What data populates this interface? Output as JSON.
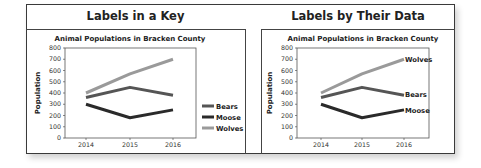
{
  "panels": {
    "left_title": "Labels in a Key",
    "right_title": "Labels by Their Data"
  },
  "chart_data": [
    {
      "type": "line",
      "title": "Animal Populations in Bracken County",
      "panel_heading": "Labels in a Key",
      "xlabel": "",
      "ylabel": "Population",
      "x": [
        "2014",
        "2015",
        "2016"
      ],
      "ylim": [
        0,
        800
      ],
      "yticks": [
        0,
        100,
        200,
        300,
        400,
        500,
        600,
        700,
        800
      ],
      "grid": false,
      "legend_position": "right",
      "series": [
        {
          "name": "Bears",
          "values": [
            360,
            450,
            380
          ],
          "color": "#555555"
        },
        {
          "name": "Moose",
          "values": [
            300,
            180,
            250
          ],
          "color": "#2a2a2a"
        },
        {
          "name": "Wolves",
          "values": [
            400,
            570,
            700
          ],
          "color": "#9a9a9a"
        }
      ]
    },
    {
      "type": "line",
      "title": "Animal Populations in Bracken County",
      "panel_heading": "Labels by Their Data",
      "xlabel": "",
      "ylabel": "Population",
      "x": [
        "2014",
        "2015",
        "2016"
      ],
      "ylim": [
        0,
        800
      ],
      "yticks": [
        0,
        100,
        200,
        300,
        400,
        500,
        600,
        700,
        800
      ],
      "grid": false,
      "legend_position": "none (direct labels at line ends)",
      "series": [
        {
          "name": "Bears",
          "values": [
            360,
            450,
            380
          ],
          "color": "#555555"
        },
        {
          "name": "Moose",
          "values": [
            300,
            180,
            250
          ],
          "color": "#2a2a2a"
        },
        {
          "name": "Wolves",
          "values": [
            400,
            570,
            700
          ],
          "color": "#9a9a9a"
        }
      ]
    }
  ],
  "legend": {
    "bears": "Bears",
    "moose": "Moose",
    "wolves": "Wolves"
  },
  "axes": {
    "title": "Animal Populations in Bracken County",
    "ylabel": "Population",
    "xticks": [
      "2014",
      "2015",
      "2016"
    ],
    "yticks": [
      "0",
      "100",
      "200",
      "300",
      "400",
      "500",
      "600",
      "700",
      "800"
    ]
  }
}
